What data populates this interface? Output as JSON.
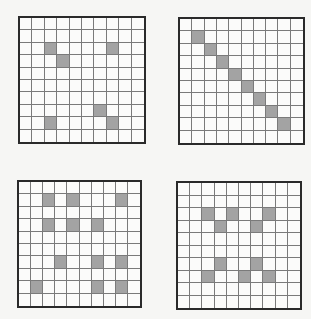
{
  "figure": {
    "grid_size": {
      "rows": 10,
      "cols": 10
    },
    "colors": {
      "shaded": "#a3a3a3",
      "empty": "#fbfbfa",
      "border": "#2a2a2a",
      "line": "#7a7a7a"
    },
    "grids": [
      {
        "id": "grid-a",
        "position": "top-left",
        "shaded": [
          [
            2,
            2
          ],
          [
            2,
            7
          ],
          [
            3,
            3
          ],
          [
            7,
            6
          ],
          [
            8,
            2
          ],
          [
            8,
            7
          ]
        ]
      },
      {
        "id": "grid-b",
        "position": "top-right",
        "shaded": [
          [
            1,
            1
          ],
          [
            2,
            2
          ],
          [
            3,
            3
          ],
          [
            4,
            4
          ],
          [
            5,
            5
          ],
          [
            6,
            6
          ],
          [
            7,
            7
          ],
          [
            8,
            8
          ]
        ]
      },
      {
        "id": "grid-c",
        "position": "bottom-left",
        "shaded": [
          [
            1,
            2
          ],
          [
            1,
            4
          ],
          [
            1,
            8
          ],
          [
            3,
            2
          ],
          [
            3,
            4
          ],
          [
            3,
            6
          ],
          [
            6,
            3
          ],
          [
            6,
            6
          ],
          [
            6,
            8
          ],
          [
            8,
            1
          ],
          [
            8,
            6
          ],
          [
            8,
            8
          ]
        ]
      },
      {
        "id": "grid-d",
        "position": "bottom-right",
        "shaded": [
          [
            2,
            2
          ],
          [
            2,
            4
          ],
          [
            2,
            7
          ],
          [
            3,
            3
          ],
          [
            3,
            6
          ],
          [
            6,
            3
          ],
          [
            6,
            6
          ],
          [
            7,
            2
          ],
          [
            7,
            5
          ],
          [
            7,
            7
          ]
        ]
      }
    ]
  }
}
